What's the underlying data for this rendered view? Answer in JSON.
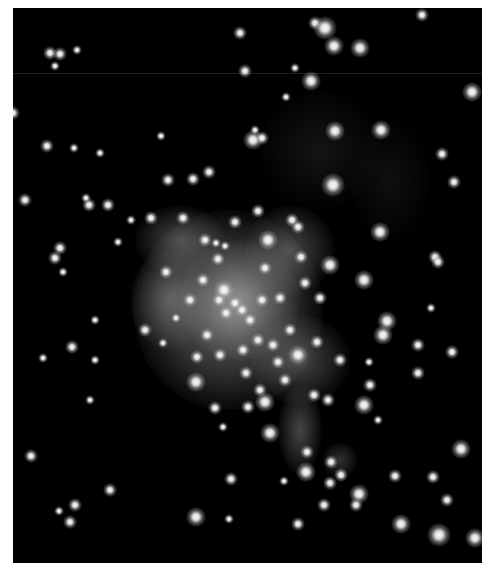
{
  "image": {
    "kind": "astronomical photograph",
    "subject": "dense star cluster with diffuse glow",
    "colors": {
      "background": "#000000",
      "border": "#ffffff",
      "star": "#f2f2f2",
      "glow": "#8a8a8a"
    },
    "frame": {
      "x": 13,
      "y": 8,
      "width": 469,
      "height": 555
    }
  },
  "nebula": [
    {
      "x": 228,
      "y": 310,
      "rx": 95,
      "ry": 100,
      "a": 0.55
    },
    {
      "x": 240,
      "y": 300,
      "rx": 60,
      "ry": 60,
      "a": 0.45
    },
    {
      "x": 180,
      "y": 240,
      "rx": 45,
      "ry": 35,
      "a": 0.35
    },
    {
      "x": 290,
      "y": 250,
      "rx": 45,
      "ry": 45,
      "a": 0.35
    },
    {
      "x": 300,
      "y": 430,
      "rx": 22,
      "ry": 45,
      "a": 0.35
    },
    {
      "x": 340,
      "y": 460,
      "rx": 18,
      "ry": 18,
      "a": 0.25
    },
    {
      "x": 320,
      "y": 150,
      "rx": 60,
      "ry": 60,
      "a": 0.1
    },
    {
      "x": 390,
      "y": 180,
      "rx": 40,
      "ry": 60,
      "a": 0.08
    },
    {
      "x": 170,
      "y": 300,
      "rx": 40,
      "ry": 50,
      "a": 0.35
    },
    {
      "x": 300,
      "y": 360,
      "rx": 50,
      "ry": 45,
      "a": 0.35
    }
  ],
  "stars": [
    {
      "x": 50,
      "y": 53,
      "r": 3
    },
    {
      "x": 60,
      "y": 54,
      "r": 3
    },
    {
      "x": 55,
      "y": 66,
      "r": 2
    },
    {
      "x": 77,
      "y": 50,
      "r": 2
    },
    {
      "x": 240,
      "y": 33,
      "r": 3
    },
    {
      "x": 245,
      "y": 71,
      "r": 3
    },
    {
      "x": 315,
      "y": 23,
      "r": 3
    },
    {
      "x": 325,
      "y": 28,
      "r": 5
    },
    {
      "x": 334,
      "y": 46,
      "r": 4
    },
    {
      "x": 360,
      "y": 48,
      "r": 4
    },
    {
      "x": 422,
      "y": 15,
      "r": 3
    },
    {
      "x": 295,
      "y": 68,
      "r": 2
    },
    {
      "x": 311,
      "y": 81,
      "r": 4
    },
    {
      "x": 286,
      "y": 97,
      "r": 2
    },
    {
      "x": 472,
      "y": 92,
      "r": 4
    },
    {
      "x": 13,
      "y": 113,
      "r": 3
    },
    {
      "x": 47,
      "y": 146,
      "r": 3
    },
    {
      "x": 74,
      "y": 148,
      "r": 2
    },
    {
      "x": 100,
      "y": 153,
      "r": 2
    },
    {
      "x": 161,
      "y": 136,
      "r": 2
    },
    {
      "x": 255,
      "y": 130,
      "r": 2
    },
    {
      "x": 253,
      "y": 140,
      "r": 4
    },
    {
      "x": 262,
      "y": 138,
      "r": 3
    },
    {
      "x": 335,
      "y": 131,
      "r": 4
    },
    {
      "x": 381,
      "y": 130,
      "r": 4
    },
    {
      "x": 442,
      "y": 154,
      "r": 3
    },
    {
      "x": 168,
      "y": 180,
      "r": 3
    },
    {
      "x": 193,
      "y": 179,
      "r": 3
    },
    {
      "x": 209,
      "y": 172,
      "r": 3
    },
    {
      "x": 333,
      "y": 185,
      "r": 5
    },
    {
      "x": 454,
      "y": 182,
      "r": 3
    },
    {
      "x": 25,
      "y": 200,
      "r": 3
    },
    {
      "x": 86,
      "y": 198,
      "r": 2
    },
    {
      "x": 89,
      "y": 205,
      "r": 3
    },
    {
      "x": 108,
      "y": 205,
      "r": 3
    },
    {
      "x": 131,
      "y": 220,
      "r": 2
    },
    {
      "x": 60,
      "y": 248,
      "r": 3
    },
    {
      "x": 55,
      "y": 258,
      "r": 3
    },
    {
      "x": 118,
      "y": 242,
      "r": 2
    },
    {
      "x": 151,
      "y": 218,
      "r": 3
    },
    {
      "x": 380,
      "y": 232,
      "r": 4
    },
    {
      "x": 435,
      "y": 257,
      "r": 3
    },
    {
      "x": 438,
      "y": 262,
      "r": 3
    },
    {
      "x": 364,
      "y": 280,
      "r": 4
    },
    {
      "x": 431,
      "y": 308,
      "r": 2
    },
    {
      "x": 387,
      "y": 321,
      "r": 4
    },
    {
      "x": 383,
      "y": 335,
      "r": 4
    },
    {
      "x": 418,
      "y": 345,
      "r": 3
    },
    {
      "x": 452,
      "y": 352,
      "r": 3
    },
    {
      "x": 418,
      "y": 373,
      "r": 3
    },
    {
      "x": 369,
      "y": 362,
      "r": 2
    },
    {
      "x": 370,
      "y": 385,
      "r": 3
    },
    {
      "x": 364,
      "y": 405,
      "r": 4
    },
    {
      "x": 378,
      "y": 420,
      "r": 2
    },
    {
      "x": 63,
      "y": 272,
      "r": 2
    },
    {
      "x": 95,
      "y": 320,
      "r": 2
    },
    {
      "x": 72,
      "y": 347,
      "r": 3
    },
    {
      "x": 43,
      "y": 358,
      "r": 2
    },
    {
      "x": 95,
      "y": 360,
      "r": 2
    },
    {
      "x": 90,
      "y": 400,
      "r": 2
    },
    {
      "x": 31,
      "y": 456,
      "r": 3
    },
    {
      "x": 110,
      "y": 490,
      "r": 3
    },
    {
      "x": 75,
      "y": 505,
      "r": 3
    },
    {
      "x": 70,
      "y": 522,
      "r": 3
    },
    {
      "x": 59,
      "y": 511,
      "r": 2
    },
    {
      "x": 215,
      "y": 408,
      "r": 3
    },
    {
      "x": 223,
      "y": 427,
      "r": 2
    },
    {
      "x": 270,
      "y": 433,
      "r": 4
    },
    {
      "x": 307,
      "y": 452,
      "r": 3
    },
    {
      "x": 306,
      "y": 472,
      "r": 4
    },
    {
      "x": 331,
      "y": 462,
      "r": 3
    },
    {
      "x": 341,
      "y": 475,
      "r": 3
    },
    {
      "x": 330,
      "y": 483,
      "r": 3
    },
    {
      "x": 231,
      "y": 479,
      "r": 3
    },
    {
      "x": 284,
      "y": 481,
      "r": 2
    },
    {
      "x": 359,
      "y": 494,
      "r": 4
    },
    {
      "x": 324,
      "y": 505,
      "r": 3
    },
    {
      "x": 395,
      "y": 476,
      "r": 3
    },
    {
      "x": 433,
      "y": 477,
      "r": 3
    },
    {
      "x": 461,
      "y": 449,
      "r": 4
    },
    {
      "x": 447,
      "y": 500,
      "r": 3
    },
    {
      "x": 196,
      "y": 517,
      "r": 4
    },
    {
      "x": 229,
      "y": 519,
      "r": 2
    },
    {
      "x": 298,
      "y": 524,
      "r": 3
    },
    {
      "x": 401,
      "y": 524,
      "r": 4
    },
    {
      "x": 439,
      "y": 535,
      "r": 5
    },
    {
      "x": 475,
      "y": 538,
      "r": 4
    },
    {
      "x": 356,
      "y": 505,
      "r": 3
    },
    {
      "x": 205,
      "y": 240,
      "r": 3
    },
    {
      "x": 216,
      "y": 243,
      "r": 2
    },
    {
      "x": 225,
      "y": 246,
      "r": 2
    },
    {
      "x": 258,
      "y": 211,
      "r": 3
    },
    {
      "x": 265,
      "y": 268,
      "r": 3
    },
    {
      "x": 292,
      "y": 220,
      "r": 3
    },
    {
      "x": 298,
      "y": 227,
      "r": 3
    },
    {
      "x": 301,
      "y": 257,
      "r": 3
    },
    {
      "x": 268,
      "y": 240,
      "r": 4
    },
    {
      "x": 218,
      "y": 259,
      "r": 3
    },
    {
      "x": 203,
      "y": 280,
      "r": 3
    },
    {
      "x": 224,
      "y": 290,
      "r": 4
    },
    {
      "x": 219,
      "y": 300,
      "r": 3
    },
    {
      "x": 235,
      "y": 303,
      "r": 3
    },
    {
      "x": 242,
      "y": 310,
      "r": 3
    },
    {
      "x": 226,
      "y": 313,
      "r": 3
    },
    {
      "x": 250,
      "y": 320,
      "r": 3
    },
    {
      "x": 262,
      "y": 300,
      "r": 3
    },
    {
      "x": 280,
      "y": 298,
      "r": 3
    },
    {
      "x": 290,
      "y": 330,
      "r": 3
    },
    {
      "x": 273,
      "y": 345,
      "r": 3
    },
    {
      "x": 258,
      "y": 340,
      "r": 3
    },
    {
      "x": 243,
      "y": 350,
      "r": 3
    },
    {
      "x": 207,
      "y": 335,
      "r": 3
    },
    {
      "x": 190,
      "y": 300,
      "r": 3
    },
    {
      "x": 176,
      "y": 318,
      "r": 2
    },
    {
      "x": 166,
      "y": 272,
      "r": 3
    },
    {
      "x": 163,
      "y": 343,
      "r": 2
    },
    {
      "x": 197,
      "y": 357,
      "r": 3
    },
    {
      "x": 220,
      "y": 355,
      "r": 3
    },
    {
      "x": 246,
      "y": 373,
      "r": 3
    },
    {
      "x": 278,
      "y": 362,
      "r": 3
    },
    {
      "x": 298,
      "y": 355,
      "r": 4
    },
    {
      "x": 317,
      "y": 342,
      "r": 3
    },
    {
      "x": 320,
      "y": 298,
      "r": 3
    },
    {
      "x": 330,
      "y": 265,
      "r": 4
    },
    {
      "x": 305,
      "y": 283,
      "r": 3
    },
    {
      "x": 196,
      "y": 382,
      "r": 4
    },
    {
      "x": 260,
      "y": 390,
      "r": 3
    },
    {
      "x": 285,
      "y": 380,
      "r": 3
    },
    {
      "x": 265,
      "y": 402,
      "r": 4
    },
    {
      "x": 248,
      "y": 407,
      "r": 3
    },
    {
      "x": 314,
      "y": 395,
      "r": 3
    },
    {
      "x": 328,
      "y": 400,
      "r": 3
    },
    {
      "x": 340,
      "y": 360,
      "r": 3
    },
    {
      "x": 145,
      "y": 330,
      "r": 3
    },
    {
      "x": 235,
      "y": 222,
      "r": 3
    },
    {
      "x": 183,
      "y": 218,
      "r": 3
    }
  ]
}
